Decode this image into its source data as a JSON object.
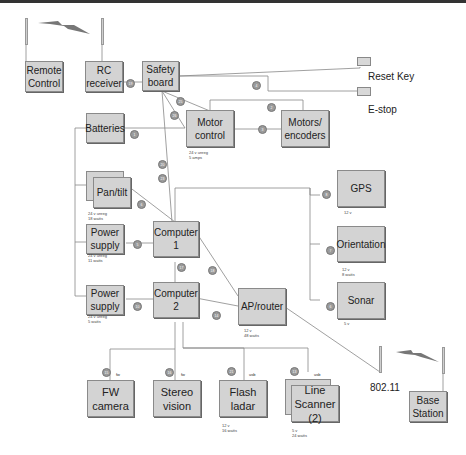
{
  "diagram": {
    "nodes": {
      "remote_control": "Remote Control",
      "rc_receiver": "RC receiver",
      "safety_board": "Safety board",
      "reset_key": "Reset Key",
      "estop": "E-stop",
      "batteries": "Batteries",
      "motor_control": "Motor control",
      "motors_encoders": "Motors/ encoders",
      "pan_tilt": "Pan/tilt",
      "gps": "GPS",
      "orientation": "Orientation",
      "sonar": "Sonar",
      "power_supply_1": "Power supply",
      "power_supply_2": "Power supply",
      "computer_1": "Computer 1",
      "computer_2": "Computer 2",
      "ap_router": "AP/router",
      "wifi": "802.11",
      "base_station": "Base Station",
      "fw_camera": "FW camera",
      "stereo_vision": "Stereo vision",
      "flash_ladar": "Flash ladar",
      "line_scanner": "Line Scanner (2)"
    },
    "notes": {
      "motor_control": "24 v unreg\n5 amps",
      "pan_tilt": "24 v unreg\n18 watts",
      "power_supply_1": "24 v unreg\n11 watts",
      "power_supply_2": "24 v unreg\n5 watts",
      "gps": "12 v",
      "orientation": "12 v\n8 watts",
      "sonar": "5 v",
      "ap_router": "12 v\n48 watts",
      "flash_ladar": "12 v\n16 watts",
      "line_scanner": "5 v\n24 watts"
    },
    "port_labels": {
      "fw_camera": "fw",
      "stereo_vision": "fw",
      "flash_ladar": "usb",
      "line_scanner": "usb"
    },
    "badges": [
      "19",
      "4",
      "25",
      "2",
      "26",
      "3",
      "1",
      "20",
      "23",
      "6",
      "8",
      "7",
      "6",
      "5",
      "17",
      "18",
      "10",
      "14",
      "15",
      "16",
      "21",
      "13"
    ]
  }
}
